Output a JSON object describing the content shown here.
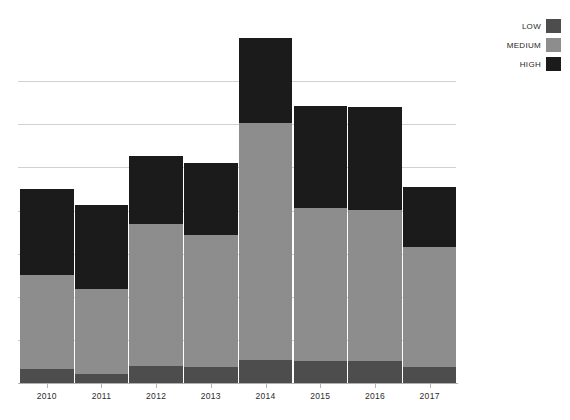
{
  "chart_data": {
    "type": "bar",
    "subtype": "stacked-bar",
    "title": "",
    "xlabel": "",
    "ylabel": "",
    "categories": [
      "2010",
      "2011",
      "2012",
      "2013",
      "2014",
      "2015",
      "2016",
      "2017"
    ],
    "series": [
      {
        "name": "LOW",
        "color": "#4d4d4d",
        "values": [
          3.3,
          2.2,
          3.9,
          3.7,
          5.4,
          5.0,
          5.0,
          3.7
        ]
      },
      {
        "name": "MEDIUM",
        "color": "#8d8d8d",
        "values": [
          21.7,
          19.6,
          33.0,
          30.7,
          55.0,
          35.7,
          35.2,
          27.8
        ]
      },
      {
        "name": "HIGH",
        "color": "#1b1b1b",
        "values": [
          20.0,
          19.6,
          15.7,
          16.7,
          19.6,
          23.5,
          23.9,
          13.9
        ]
      }
    ],
    "totals": [
      45.0,
      41.3,
      52.6,
      51.1,
      80.0,
      64.1,
      64.1,
      45.4
    ],
    "ylim": [
      0,
      87
    ],
    "ytick_values": [
      10,
      20,
      30,
      40,
      50,
      60,
      70
    ],
    "ytick_labels_visible": false,
    "grid": true,
    "grid_axis": "y",
    "legend_position": "top-right",
    "legend_entries": [
      "LOW",
      "MEDIUM",
      "HIGH"
    ]
  },
  "legend": {
    "items": [
      {
        "label": "LOW",
        "color": "#4d4d4d"
      },
      {
        "label": "MEDIUM",
        "color": "#8d8d8d"
      },
      {
        "label": "HIGH",
        "color": "#1b1b1b"
      }
    ]
  },
  "axis": {
    "x_labels": [
      "2010",
      "2011",
      "2012",
      "2013",
      "2014",
      "2015",
      "2016",
      "2017"
    ]
  },
  "colors": {
    "low": "#4d4d4d",
    "medium": "#8d8d8d",
    "high": "#1b1b1b",
    "gridline": "#c9c9c9",
    "axis": "#b0b0b0",
    "background": "#ffffff"
  }
}
